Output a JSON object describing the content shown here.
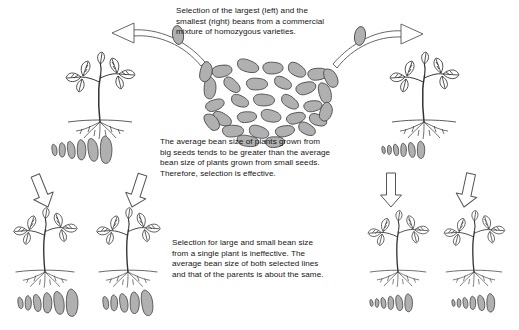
{
  "figure": {
    "title_text_blocks": {
      "top": "Selection of the largest (left) and the\nsmallest (right) beans from a commercial\nmixture of homozygous varieties.",
      "middle": "The average bean size of plants grown from\nbig seeds tends to be greater than the average\nbean size of plants grown from small seeds.\nTherefore, selection is effective.",
      "bottom": "Selection for large and small bean size\nfrom a single plant is ineffective.  The\naverage bean size of both selected lines\nand that of the parents is about the same."
    },
    "colors": {
      "bean_fill": "#b0b0b0",
      "bean_outline": "#4a4a4a",
      "line": "#333333",
      "arrow_outline": "#555555",
      "background": "#ffffff",
      "text": "#151515"
    },
    "bean_pile": {
      "label": "commercial mixture of homozygous varieties",
      "count": 31,
      "beans": [
        {
          "cx": 222,
          "cy": 71,
          "rx": 10,
          "ry": 5.5,
          "rot": -18
        },
        {
          "cx": 248,
          "cy": 66,
          "rx": 11,
          "ry": 5.5,
          "rot": 12
        },
        {
          "cx": 273,
          "cy": 68,
          "rx": 10,
          "ry": 5.5,
          "rot": -8
        },
        {
          "cx": 297,
          "cy": 70,
          "rx": 9.5,
          "ry": 5.5,
          "rot": 24
        },
        {
          "cx": 318,
          "cy": 74,
          "rx": 10,
          "ry": 5.5,
          "rot": -14
        },
        {
          "cx": 210,
          "cy": 88,
          "rx": 6,
          "ry": 10,
          "rot": 8
        },
        {
          "cx": 232,
          "cy": 85,
          "rx": 9.5,
          "ry": 5,
          "rot": 34
        },
        {
          "cx": 257,
          "cy": 84,
          "rx": 10.5,
          "ry": 5.5,
          "rot": -6
        },
        {
          "cx": 283,
          "cy": 83,
          "rx": 9,
          "ry": 5,
          "rot": 18
        },
        {
          "cx": 306,
          "cy": 88,
          "rx": 10,
          "ry": 5.5,
          "rot": -24
        },
        {
          "cx": 325,
          "cy": 93,
          "rx": 6,
          "ry": 9.5,
          "rot": -10
        },
        {
          "cx": 215,
          "cy": 105,
          "rx": 9.5,
          "ry": 5,
          "rot": -28
        },
        {
          "cx": 240,
          "cy": 101,
          "rx": 9,
          "ry": 5,
          "rot": 16
        },
        {
          "cx": 264,
          "cy": 100,
          "rx": 10.5,
          "ry": 5.5,
          "rot": -4
        },
        {
          "cx": 290,
          "cy": 102,
          "rx": 9.5,
          "ry": 5,
          "rot": 28
        },
        {
          "cx": 313,
          "cy": 106,
          "rx": 9,
          "ry": 5,
          "rot": -16
        },
        {
          "cx": 222,
          "cy": 119,
          "rx": 10,
          "ry": 5.5,
          "rot": 20
        },
        {
          "cx": 247,
          "cy": 117,
          "rx": 9.5,
          "ry": 5,
          "rot": -12
        },
        {
          "cx": 271,
          "cy": 116,
          "rx": 10,
          "ry": 5.5,
          "rot": 6
        },
        {
          "cx": 296,
          "cy": 118,
          "rx": 9.5,
          "ry": 5,
          "rot": -22
        },
        {
          "cx": 318,
          "cy": 120,
          "rx": 9,
          "ry": 5,
          "rot": 14
        },
        {
          "cx": 233,
          "cy": 131,
          "rx": 10.5,
          "ry": 5.5,
          "rot": -8
        },
        {
          "cx": 259,
          "cy": 132,
          "rx": 10,
          "ry": 5.5,
          "rot": 10
        },
        {
          "cx": 285,
          "cy": 131,
          "rx": 9.5,
          "ry": 5,
          "rot": -18
        },
        {
          "cx": 307,
          "cy": 129,
          "rx": 9,
          "ry": 5,
          "rot": 22
        },
        {
          "cx": 248,
          "cy": 141,
          "rx": 11,
          "ry": 5,
          "rot": 4
        },
        {
          "cx": 275,
          "cy": 142,
          "rx": 9.5,
          "ry": 5,
          "rot": -10
        },
        {
          "cx": 206,
          "cy": 72,
          "rx": 6,
          "ry": 9,
          "rot": 20
        },
        {
          "cx": 331,
          "cy": 78,
          "rx": 6,
          "ry": 9,
          "rot": -20
        },
        {
          "cx": 212,
          "cy": 122,
          "rx": 6,
          "ry": 8.5,
          "rot": -30
        },
        {
          "cx": 326,
          "cy": 112,
          "rx": 6,
          "ry": 8.5,
          "rot": 26
        }
      ]
    },
    "parent_plants": [
      {
        "name": "large-seed-parent-plant",
        "side": "left",
        "x": 100,
        "y": 118,
        "scale": 1.0
      },
      {
        "name": "small-seed-parent-plant",
        "side": "right",
        "x": 424,
        "y": 118,
        "scale": 1.0
      }
    ],
    "selection_arrows": [
      {
        "name": "arrow-to-largest-beans",
        "direction": "left",
        "label": "largest beans selected"
      },
      {
        "name": "arrow-to-smallest-beans",
        "direction": "right",
        "label": "smallest beans selected"
      }
    ],
    "bean_rows": [
      {
        "name": "large-parent-bean-row",
        "position": "upper-left",
        "x": 52,
        "y": 150,
        "count": 6,
        "sizes": [
          4.0,
          5.0,
          6.0,
          7.0,
          8.0,
          9.5
        ],
        "description": "beans from large-seed parent plant, graded small to large"
      },
      {
        "name": "small-parent-bean-row",
        "position": "upper-right",
        "x": 382,
        "y": 150,
        "count": 6,
        "sizes": [
          2.6,
          3.2,
          4.0,
          4.6,
          5.2,
          6.0
        ],
        "description": "beans from small-seed parent plant, graded small to large"
      },
      {
        "name": "large-line-selected-small-bean-row",
        "position": "lower-left-a",
        "x": 18,
        "y": 303,
        "count": 6,
        "sizes": [
          4.0,
          5.0,
          6.0,
          7.0,
          8.0,
          9.5
        ],
        "description": "progeny beans of large line, small-selected"
      },
      {
        "name": "large-line-selected-large-bean-row",
        "position": "lower-left-b",
        "x": 103,
        "y": 303,
        "count": 5,
        "sizes": [
          4.5,
          5.5,
          6.5,
          7.5,
          9.0
        ],
        "description": "progeny beans of large line, large-selected"
      },
      {
        "name": "small-line-selected-small-bean-row",
        "position": "lower-right-a",
        "x": 370,
        "y": 303,
        "count": 6,
        "sizes": [
          2.4,
          3.0,
          3.8,
          4.6,
          5.4,
          6.2
        ],
        "description": "progeny beans of small line, small-selected"
      },
      {
        "name": "small-line-selected-large-bean-row",
        "position": "lower-right-b",
        "x": 452,
        "y": 303,
        "count": 6,
        "sizes": [
          2.4,
          3.0,
          3.8,
          4.6,
          5.4,
          6.4
        ],
        "description": "progeny beans of small line, large-selected"
      }
    ],
    "progeny_plants": [
      {
        "name": "large-line-progeny-plant-a",
        "x": 42,
        "y": 268
      },
      {
        "name": "large-line-progeny-plant-b",
        "x": 125,
        "y": 268
      },
      {
        "name": "small-line-progeny-plant-a",
        "x": 395,
        "y": 268
      },
      {
        "name": "small-line-progeny-plant-b",
        "x": 472,
        "y": 268
      }
    ],
    "block_arrows": [
      {
        "name": "block-arrow-large-line-left",
        "tilt": -22
      },
      {
        "name": "block-arrow-large-line-right",
        "tilt": 18
      },
      {
        "name": "block-arrow-small-line-left",
        "tilt": 0
      },
      {
        "name": "block-arrow-small-line-right",
        "tilt": 0
      }
    ]
  }
}
